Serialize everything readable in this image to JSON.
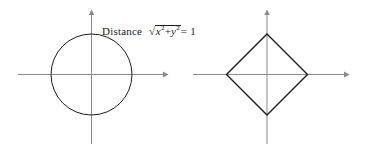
{
  "figures": [
    {
      "id": "circle",
      "name": "unit-circle-euclidean-distance",
      "shape": "circle",
      "label": {
        "lead": "Distance",
        "expression_plain": "√(x² + y²) = 1",
        "radical_sign": "√",
        "term1_var": "x",
        "term1_exp": "2",
        "operator": "+",
        "term2_var": "y",
        "term2_exp": "2",
        "equals": "= 1"
      },
      "geometry": {
        "center": [
          91.5,
          74.5
        ],
        "radius": 40.5,
        "axis_x_from": 18,
        "axis_x_to": 166,
        "axis_y_from": 12,
        "axis_y_to": 144,
        "arrow_right": true,
        "arrow_up": true
      }
    },
    {
      "id": "diamond",
      "name": "unit-diamond-taxicab-distance",
      "shape": "diamond",
      "label": {
        "lead": "Distance",
        "expression_plain": "|x| + |y| = 1",
        "abs_open": "|",
        "abs_close": "|",
        "term1_var": "x",
        "operator": "+",
        "term2_var": "y",
        "equals": "= 1"
      },
      "geometry": {
        "center": [
          78,
          74.5
        ],
        "radius": 40.5,
        "axis_x_from": 4,
        "axis_x_to": 158,
        "axis_y_from": 12,
        "axis_y_to": 144,
        "arrow_right": true,
        "arrow_up": true
      }
    }
  ],
  "style": {
    "background": "#ffffff",
    "axis_color": "#8a8a8a",
    "curve_color": "#1c1c1c",
    "text_color": "#1c1c1c"
  }
}
